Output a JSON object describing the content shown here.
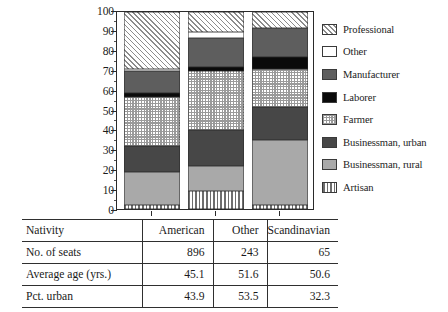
{
  "chart_data": {
    "type": "bar",
    "subtype": "stacked-100-percent",
    "title": "",
    "xlabel": "Nativity",
    "ylabel": "",
    "ylim": [
      0,
      100
    ],
    "yticks": [
      0,
      10,
      20,
      30,
      40,
      50,
      60,
      70,
      80,
      90,
      100
    ],
    "ytick_labels": [
      "0",
      "10",
      "20",
      "30",
      "40",
      "50",
      "60",
      "70",
      "80",
      "90",
      "100"
    ],
    "grid": false,
    "legend_position": "right",
    "categories": [
      "American",
      "Other",
      "Scandinavian"
    ],
    "series": [
      {
        "name": "Artisan",
        "key": "artisan",
        "values": [
          2,
          9,
          2
        ],
        "color": "#ffffff",
        "pattern": "vertical-stripes"
      },
      {
        "name": "Businessman, rural",
        "key": "businessman-rural",
        "values": [
          17,
          13,
          33
        ],
        "color": "#a9a9a9",
        "pattern": "solid"
      },
      {
        "name": "Businessman, urban",
        "key": "businessman-urban",
        "values": [
          13,
          18,
          17
        ],
        "color": "#474747",
        "pattern": "solid"
      },
      {
        "name": "Farmer",
        "key": "farmer",
        "values": [
          25,
          30,
          19
        ],
        "color": "#ffffff",
        "pattern": "checkered"
      },
      {
        "name": "Laborer",
        "key": "laborer",
        "values": [
          2,
          2,
          6
        ],
        "color": "#0a0a0a",
        "pattern": "solid"
      },
      {
        "name": "Manufacturer",
        "key": "manufacturer",
        "values": [
          11,
          15,
          15
        ],
        "color": "#5e5e5e",
        "pattern": "solid"
      },
      {
        "name": "Other",
        "key": "other",
        "values": [
          1,
          3,
          0
        ],
        "color": "#ffffff",
        "pattern": "solid"
      },
      {
        "name": "Professional",
        "key": "professional",
        "values": [
          29,
          10,
          8
        ],
        "color": "#f2f2f2",
        "pattern": "diagonal-hatch"
      }
    ]
  },
  "legend": {
    "items": [
      {
        "label": "Professional",
        "swatch": "professional"
      },
      {
        "label": "Other",
        "swatch": "other"
      },
      {
        "label": "Manufacturer",
        "swatch": "manufacturer"
      },
      {
        "label": "Laborer",
        "swatch": "laborer"
      },
      {
        "label": "Farmer",
        "swatch": "farmer"
      },
      {
        "label": "Businessman, urban",
        "swatch": "businessman-urban"
      },
      {
        "label": "Businessman, rural",
        "swatch": "businessman-rural"
      },
      {
        "label": "Artisan",
        "swatch": "artisan"
      }
    ]
  },
  "table": {
    "header": {
      "row_label": "Nativity",
      "columns": [
        "American",
        "Other",
        "Scandinavian"
      ]
    },
    "rows": [
      {
        "label": "No. of seats",
        "values": [
          "896",
          "243",
          "65"
        ]
      },
      {
        "label": "Average age (yrs.)",
        "values": [
          "45.1",
          "51.6",
          "50.6"
        ]
      },
      {
        "label": "Pct. urban",
        "values": [
          "43.9",
          "53.5",
          "32.3"
        ]
      }
    ]
  },
  "colors": {
    "axis": "#2a2a2a",
    "text": "#1c1c1c",
    "table_rule": "#2f2f2f",
    "background": "#ffffff"
  }
}
